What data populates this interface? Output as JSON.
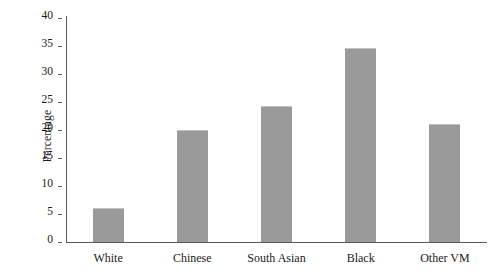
{
  "chart_data": {
    "type": "bar",
    "title": "",
    "subtitle": "",
    "xlabel": "",
    "ylabel": "Percentage",
    "categories": [
      "White",
      "Chinese",
      "South Asian",
      "Black",
      "Other VM"
    ],
    "values": [
      6.0,
      20.0,
      24.3,
      34.7,
      21.1
    ],
    "ylim": [
      0,
      40
    ],
    "yticks": [
      0,
      5,
      10,
      15,
      20,
      25,
      30,
      35,
      40
    ],
    "ytick_labels": [
      "0",
      "5",
      "10",
      "15",
      "20",
      "25",
      "30",
      "35",
      "40"
    ],
    "grid": false,
    "legend": null,
    "bar_color": "#9a9a9a",
    "bar_edge_color": "#c2c2c2",
    "axis_color": "#55595e",
    "background_color": "#ffffff"
  }
}
